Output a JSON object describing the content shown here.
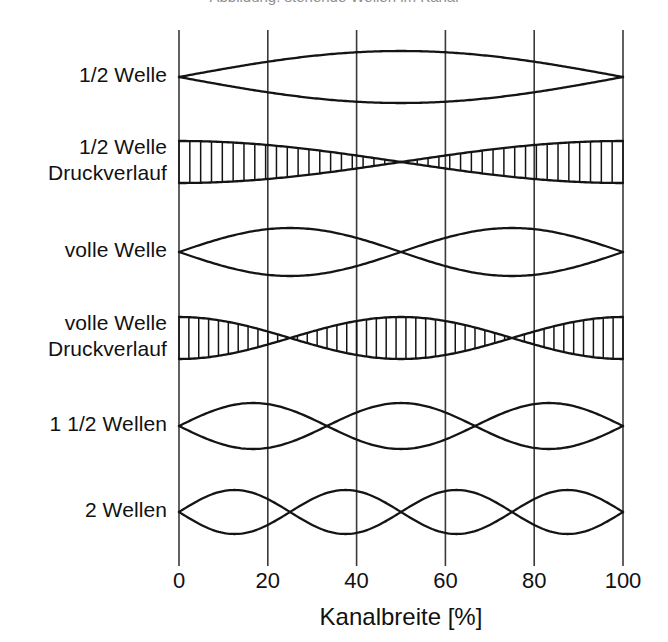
{
  "figure": {
    "background_color": "#ffffff",
    "line_color": "#141414",
    "grid_color": "#3a3a3a",
    "clipped_caption_top": "Abbildung: stehende Wellen im Kanal",
    "axis": {
      "title": "Kanalbreite [%]",
      "tick_labels": [
        "0",
        "20",
        "40",
        "60",
        "80",
        "100"
      ],
      "tick_values": [
        0,
        20,
        40,
        60,
        80,
        100
      ]
    },
    "row_labels": [
      {
        "line1": "1/2 Welle",
        "line2": ""
      },
      {
        "line1": "1/2 Welle",
        "line2": "Druckverlauf"
      },
      {
        "line1": "volle Welle",
        "line2": ""
      },
      {
        "line1": "volle Welle",
        "line2": "Druckverlauf"
      },
      {
        "line1": "1 1/2 Wellen",
        "line2": ""
      },
      {
        "line1": "2 Wellen",
        "line2": ""
      }
    ]
  },
  "chart_data": {
    "type": "line",
    "title": "",
    "xlabel": "Kanalbreite [%]",
    "ylabel": "",
    "xlim": [
      0,
      100
    ],
    "xticks": [
      0,
      20,
      40,
      60,
      80,
      100
    ],
    "xtick_labels": [
      "0",
      "20",
      "40",
      "60",
      "80",
      "100"
    ],
    "grid": true,
    "grid_axis": "x",
    "legend": "none",
    "plot_px": {
      "x_left": 179,
      "x_right": 623,
      "y_top": 30,
      "y_bottom": 556
    },
    "series": [
      {
        "name": "1/2 Welle",
        "row": 1,
        "label_line1": "1/2 Welle",
        "label_line2": "",
        "envelope": "sine",
        "mode": "half-wave displacement",
        "half_periods": 1,
        "nodes_percent": [
          0,
          100
        ],
        "antinodes_percent": [
          50
        ],
        "amplitude_px": 26,
        "center_y_px": 77,
        "hatched": false,
        "formula": "y = A * sin(pi * x / 100)"
      },
      {
        "name": "1/2 Welle Druckverlauf",
        "row": 2,
        "label_line1": "1/2 Welle",
        "label_line2": "Druckverlauf",
        "envelope": "cosine",
        "mode": "half-wave pressure",
        "half_periods": 1,
        "nodes_percent": [
          50
        ],
        "antinodes_percent": [
          0,
          100
        ],
        "amplitude_px": 21,
        "center_y_px": 162,
        "hatched": true,
        "hatch_count": 41,
        "formula": "y = A * cos(pi * x / 100)"
      },
      {
        "name": "volle Welle",
        "row": 3,
        "label_line1": "volle Welle",
        "label_line2": "",
        "envelope": "sine",
        "mode": "full-wave displacement",
        "half_periods": 2,
        "nodes_percent": [
          0,
          50,
          100
        ],
        "antinodes_percent": [
          25,
          75
        ],
        "amplitude_px": 24,
        "center_y_px": 252,
        "hatched": false,
        "formula": "y = A * sin(2 * pi * x / 100)"
      },
      {
        "name": "volle Welle Druckverlauf",
        "row": 4,
        "label_line1": "volle Welle",
        "label_line2": "Druckverlauf",
        "envelope": "cosine",
        "mode": "full-wave pressure",
        "half_periods": 2,
        "nodes_percent": [
          25,
          75
        ],
        "antinodes_percent": [
          0,
          50,
          100
        ],
        "amplitude_px": 21,
        "center_y_px": 338,
        "hatched": true,
        "hatch_count": 45,
        "formula": "y = A * cos(2 * pi * x / 100)"
      },
      {
        "name": "1 1/2 Wellen",
        "row": 5,
        "label_line1": "1 1/2 Wellen",
        "label_line2": "",
        "envelope": "sine",
        "mode": "three-half-wave displacement",
        "half_periods": 3,
        "nodes_percent": [
          0,
          33.3,
          66.7,
          100
        ],
        "antinodes_percent": [
          16.7,
          50,
          83.3
        ],
        "amplitude_px": 23,
        "center_y_px": 426,
        "hatched": false,
        "formula": "y = A * sin(3 * pi * x / 100)"
      },
      {
        "name": "2 Wellen",
        "row": 6,
        "label_line1": "2 Wellen",
        "label_line2": "",
        "envelope": "sine",
        "mode": "two-wave displacement",
        "half_periods": 4,
        "nodes_percent": [
          0,
          25,
          50,
          75,
          100
        ],
        "antinodes_percent": [
          12.5,
          37.5,
          62.5,
          87.5
        ],
        "amplitude_px": 22,
        "center_y_px": 512,
        "hatched": false,
        "formula": "y = A * sin(4 * pi * x / 100)"
      }
    ]
  }
}
